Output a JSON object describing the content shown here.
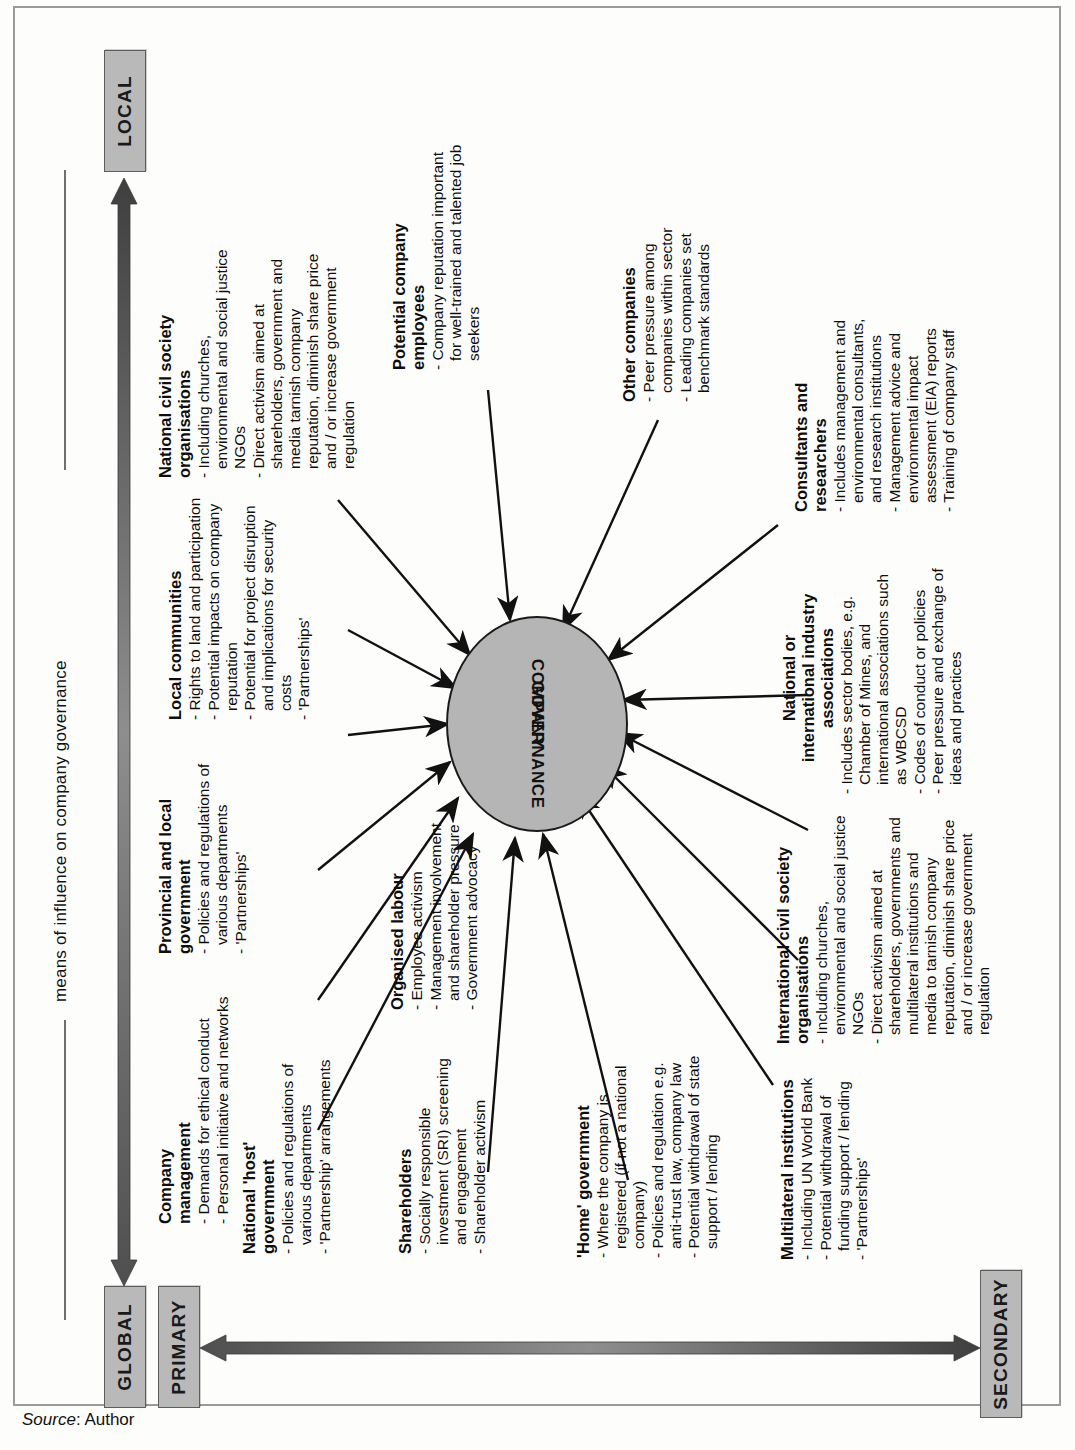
{
  "figure": {
    "title": "means of influence on company governance",
    "hub_label": "COMPANY\nGOVERNANCE",
    "hub_line1": "COMPANY",
    "hub_line2": "GOVERNANCE",
    "source_prefix": "Source",
    "source_value": ": Author"
  },
  "axes": {
    "scale": {
      "high": "GLOBAL",
      "low": "LOCAL"
    },
    "order": {
      "first": "PRIMARY",
      "second": "SECONDARY"
    }
  },
  "colors": {
    "chip_fill": "#b9b9b9",
    "chip_border": "#5d5d5d",
    "hub_fill": "#b5b5b5",
    "hub_border": "#1a1a1a",
    "arrow_dark": "#6b6b6b",
    "arrow_light": "#d8d8d8",
    "text": "#0d0d0d"
  },
  "nodes": [
    {
      "id": "company-management",
      "title": "Company\nmanagement",
      "title_lines": [
        "Company",
        "management"
      ],
      "bullets": [
        "Demands for ethical conduct",
        "Personal initiative and networks"
      ]
    },
    {
      "id": "provincial-and-local-government",
      "title_lines": [
        "Provincial and local",
        "government"
      ],
      "bullets": [
        "Policies and regulations of various departments",
        "'Partnerships'"
      ]
    },
    {
      "id": "local-communities",
      "title_lines": [
        "Local communities"
      ],
      "bullets": [
        "Rights to land and participation",
        "Potential impacts on company reputation",
        "Potential for project disruption and implications for security costs",
        "'Partnerships'"
      ]
    },
    {
      "id": "national-civil-society-organisations",
      "title_lines": [
        "National civil society",
        "organisations"
      ],
      "bullets": [
        "Including churches, environmental and social justice NGOs",
        "Direct activism aimed at shareholders, government and media tarnish company reputation, diminish share price and / or increase government regulation"
      ]
    },
    {
      "id": "potential-company-employees",
      "title_lines": [
        "Potential company",
        "employees"
      ],
      "bullets": [
        "Company reputation important for well-trained and talented job seekers"
      ]
    },
    {
      "id": "other-companies",
      "title_lines": [
        "Other companies"
      ],
      "bullets": [
        "Peer pressure among companies within sector",
        "Leading companies set benchmark standards"
      ]
    },
    {
      "id": "consultants-and-researchers",
      "title_lines": [
        "Consultants and",
        "researchers"
      ],
      "bullets": [
        "Includes management and environmental consultants, and research institutions",
        "Management advice and environmental impact assessment (EIA) reports",
        "Training of company staff"
      ]
    },
    {
      "id": "national-or-international-industry-associations",
      "title_lines": [
        "National or",
        "international industry",
        "associations"
      ],
      "bullets": [
        "Includes sector bodies, e.g. Chamber of Mines, and international associations such as WBCSD",
        "Codes of conduct or policies",
        "Peer pressure and exchange of ideas and practices"
      ]
    },
    {
      "id": "international-civil-society-organisations",
      "title_lines": [
        "International civil society",
        "organisations"
      ],
      "bullets": [
        "Including churches, environmental and social justice NGOs",
        "Direct activism aimed at shareholders, governments and multilateral institutions and media to tarnish company reputation, diminish share price and / or increase government regulation"
      ]
    },
    {
      "id": "multilateral-institutions",
      "title_lines": [
        "Multilateral institutions"
      ],
      "bullets": [
        "Including UN World Bank",
        "Potential withdrawal of funding support / lending",
        "'Partnerships'"
      ]
    },
    {
      "id": "home-government",
      "title_lines": [
        "'Home' government"
      ],
      "bullets": [
        "Where the company is registered (if not a national company)",
        "Policies and regulation e.g. anti-trust law, company law",
        "Potential withdrawal of state support / lending"
      ]
    },
    {
      "id": "shareholders",
      "title_lines": [
        "Shareholders"
      ],
      "bullets": [
        "Socially responsible investment (SRI) screening and engagement",
        "Shareholder activism"
      ]
    },
    {
      "id": "national-host-government",
      "title_lines": [
        "National 'host'",
        "government"
      ],
      "bullets": [
        "Policies and regulations of various departments",
        "'Partnership' arrangements"
      ]
    },
    {
      "id": "organised-labour",
      "title_lines": [
        "Organised labour"
      ],
      "bullets": [
        "Employee activism",
        "Management involvement and shareholder pressure",
        "Government advocacy"
      ]
    }
  ]
}
